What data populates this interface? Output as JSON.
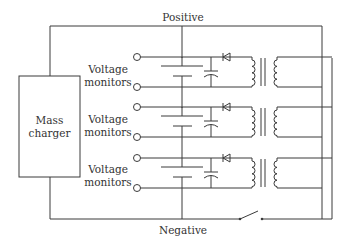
{
  "diagram": {
    "type": "circuit",
    "labels": {
      "positive": "Positive",
      "negative": "Negative",
      "charger_line1": "Mass",
      "charger_line2": "charger",
      "monitor_line1": "Voltage",
      "monitor_line2": "monitors"
    },
    "rows": [
      {
        "id": 1,
        "monitor_line1": "Voltage",
        "monitor_line2": "monitors"
      },
      {
        "id": 2,
        "monitor_line1": "Voltage",
        "monitor_line2": "monitors"
      },
      {
        "id": 3,
        "monitor_line1": "Voltage",
        "monitor_line2": "monitors"
      }
    ],
    "components": [
      "mass-charger",
      "battery-cell",
      "capacitor",
      "diode",
      "transformer",
      "switch"
    ],
    "colors": {
      "line": "#3a3a3a",
      "text": "#333333",
      "background": "#ffffff"
    }
  }
}
